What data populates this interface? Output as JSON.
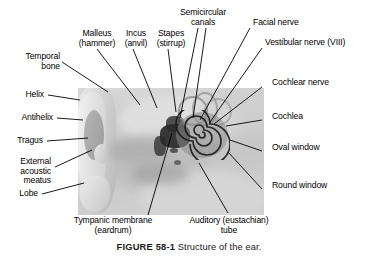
{
  "figure": {
    "number_label": "FIGURE 58-1",
    "caption_text": "Structure of the ear.",
    "image_alt_name": "ear-anatomy-photograph"
  },
  "labels": {
    "temporal_bone": {
      "line1": "Temporal",
      "line2": "bone"
    },
    "helix": {
      "line1": "Helix"
    },
    "antihelix": {
      "line1": "Antihelix"
    },
    "tragus": {
      "line1": "Tragus"
    },
    "external_acoustic_meatus": {
      "line1": "External",
      "line2": "acoustic",
      "line3": "meatus"
    },
    "lobe": {
      "line1": "Lobe"
    },
    "malleus": {
      "line1": "Malleus",
      "line2": "(hammer)"
    },
    "incus": {
      "line1": "Incus",
      "line2": "(anvil)"
    },
    "stapes": {
      "line1": "Stapes",
      "line2": "(stirrup)"
    },
    "semicircular_canals": {
      "line1": "Semicircular",
      "line2": "canals"
    },
    "facial_nerve": {
      "line1": "Facial nerve"
    },
    "vestibular_nerve": {
      "line1": "Vestibular nerve (VIII)"
    },
    "cochlear_nerve": {
      "line1": "Cochlear nerve"
    },
    "cochlea": {
      "line1": "Cochlea"
    },
    "oval_window": {
      "line1": "Oval window"
    },
    "round_window": {
      "line1": "Round window"
    },
    "tympanic_membrane": {
      "line1": "Tympanic membrane",
      "line2": "(eardrum)"
    },
    "auditory_tube": {
      "line1": "Auditory (eustachian)",
      "line2": "tube"
    }
  },
  "colors": {
    "text": "#000000",
    "leader_line": "#000000",
    "photo_background": "#cccccc",
    "photo_dark_cavity": "#2a2a2a",
    "page_background": "#ffffff"
  }
}
